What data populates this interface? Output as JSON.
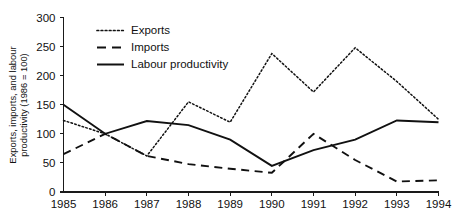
{
  "chart_data": {
    "type": "line",
    "title": "",
    "xlabel": "",
    "ylabel": "Exports, imports, and labour productivity (1986 = 100)",
    "categories": [
      "1985",
      "1986",
      "1987",
      "1988",
      "1989",
      "1990",
      "1991",
      "1992",
      "1993",
      "1994"
    ],
    "x": [
      1985,
      1986,
      1987,
      1988,
      1989,
      1990,
      1991,
      1992,
      1993,
      1994
    ],
    "xlim": [
      1985,
      1994
    ],
    "ylim": [
      0,
      300
    ],
    "yticks": [
      0,
      50,
      100,
      150,
      200,
      250,
      300
    ],
    "ytick_labels": [
      "0",
      "50",
      "100",
      "150",
      "200",
      "250",
      "300"
    ],
    "xtick_labels": [
      "1985",
      "1986",
      "1987",
      "1988",
      "1989",
      "1990",
      "1991",
      "1992",
      "1993",
      "1994"
    ],
    "grid": false,
    "legend_position": "top-center",
    "series": [
      {
        "name": "Exports",
        "style": "dotted",
        "color": "#111111",
        "values": [
          123,
          100,
          62,
          155,
          120,
          238,
          172,
          248,
          190,
          125
        ]
      },
      {
        "name": "Imports",
        "style": "dashed",
        "color": "#111111",
        "values": [
          65,
          100,
          62,
          48,
          40,
          33,
          100,
          55,
          18,
          20
        ]
      },
      {
        "name": "Labour productivity",
        "style": "solid",
        "color": "#111111",
        "values": [
          150,
          100,
          122,
          115,
          90,
          45,
          72,
          90,
          123,
          120
        ]
      }
    ]
  },
  "axis": {
    "y_title_line1": "Exports, imports, and labour",
    "y_title_line2": "productivity (1986 = 100)"
  },
  "legend": {
    "entries": [
      {
        "label": "Exports",
        "style": "dotted"
      },
      {
        "label": "Imports",
        "style": "dashed"
      },
      {
        "label": "Labour productivity",
        "style": "solid"
      }
    ]
  }
}
